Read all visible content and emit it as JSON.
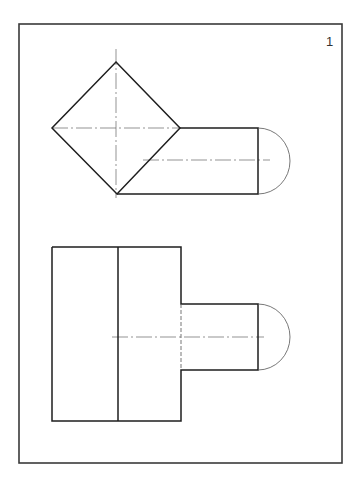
{
  "sheet": {
    "number": "1",
    "number_pos": {
      "x": 326,
      "y": 34
    }
  },
  "colors": {
    "background": "#ffffff",
    "line": "#1e1e1e",
    "frame": "#3a3a3a",
    "centerline": "#666666"
  },
  "frame": {
    "x": 19,
    "y": 24,
    "width": 323,
    "height": 439
  },
  "top_view": {
    "label": "plan view",
    "diamond": {
      "top": [
        116,
        62
      ],
      "right": [
        180,
        128
      ],
      "bottom": [
        117,
        194
      ],
      "left": [
        52,
        128
      ]
    },
    "rectangle": {
      "x1": 180,
      "y1": 128,
      "x2": 258,
      "y2": 194
    },
    "arc": {
      "x": 258,
      "y_top": 128,
      "y_bottom": 194,
      "bulge_x": 290
    },
    "centerlines": {
      "vertical": {
        "x": 116,
        "y1": 49,
        "y2": 198
      },
      "horizontal": {
        "y": 128,
        "x1": 52,
        "x2": 180
      },
      "axis": {
        "y": 160,
        "x1": 143,
        "x2": 270
      }
    }
  },
  "front_view": {
    "label": "elevation view",
    "block": {
      "x1": 52,
      "y1": 247,
      "x2": 181,
      "y2": 421
    },
    "divider": {
      "x": 118,
      "y1": 247,
      "y2": 421
    },
    "protrusion": {
      "x1": 181,
      "y1": 304,
      "x2": 258,
      "y2": 370
    },
    "hidden_line": {
      "x": 181,
      "y1": 304,
      "y2": 370
    },
    "arc": {
      "x": 258,
      "y_top": 304,
      "y_bottom": 370,
      "bulge_x": 290
    },
    "centerline": {
      "y": 337,
      "x1": 112,
      "x2": 264
    }
  }
}
